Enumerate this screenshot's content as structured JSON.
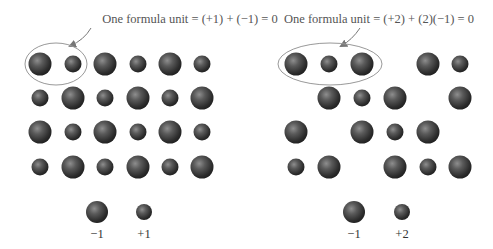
{
  "left_panel": {
    "caption": "One formula unit = (+1) + (−1) = 0",
    "legend": [
      {
        "label": "−1",
        "kind": "anion"
      },
      {
        "label": "+1",
        "kind": "cation"
      }
    ],
    "grid": [
      [
        "A",
        "C",
        "A",
        "C",
        "A",
        "C"
      ],
      [
        "C",
        "A",
        "C",
        "A",
        "C",
        "A"
      ],
      [
        "A",
        "C",
        "A",
        "C",
        "A",
        "C"
      ],
      [
        "C",
        "A",
        "C",
        "A",
        "C",
        "A"
      ]
    ]
  },
  "right_panel": {
    "caption": "One formula unit = (+2) + (2)(−1) = 0",
    "legend": [
      {
        "label": "−1",
        "kind": "anion"
      },
      {
        "label": "+2",
        "kind": "cation"
      }
    ],
    "grid": [
      [
        "A",
        "C",
        "A",
        "",
        "A",
        "C"
      ],
      [
        "",
        "A",
        "C",
        "A",
        "",
        "A"
      ],
      [
        "A",
        "",
        "A",
        "C",
        "A",
        ""
      ],
      [
        "C",
        "A",
        "",
        "A",
        "C",
        "A"
      ]
    ]
  },
  "colors": {
    "sphere_dark": "#2a2a2a",
    "sphere_mid": "#5a5a5a",
    "sphere_highlight": "#9a9a9a",
    "outline": "#8a8a8a"
  }
}
